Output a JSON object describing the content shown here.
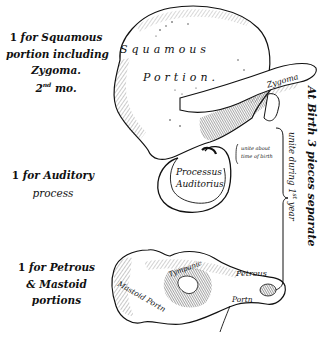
{
  "figure": {
    "colors": {
      "ink": "#111111",
      "paper": "#ffffff",
      "shade": "#555555"
    }
  },
  "left_labels": {
    "squamous": {
      "number": "1",
      "line1": "for Squamous",
      "line2": "portion including",
      "line3": "Zygoma.",
      "line4_num": "2",
      "line4_sup": "nd",
      "line4_text": "mo."
    },
    "auditory": {
      "number": "1",
      "line1": "for Auditory",
      "line2": "process"
    },
    "petrous": {
      "number": "1",
      "line1": "for Petrous",
      "line2": "& Mastoid",
      "line3": "portions"
    }
  },
  "part_labels": {
    "squamous_word": "Squamous",
    "portion_word": "Portion.",
    "zygoma": "Zygoma",
    "processus": "Processus",
    "auditorius": "Auditorius",
    "unite_about_1": "unite about",
    "unite_about_2": "time of birth",
    "tympanic": "Tympanic",
    "petrous": "Petrous",
    "portion_small": "Portn",
    "mastoid": "Mastoid Portn"
  },
  "right_vertical": {
    "main": "At Birth 3 pieces separate",
    "sub_prefix": "unite during 1",
    "sub_sup": "st",
    "sub_suffix": "year"
  }
}
